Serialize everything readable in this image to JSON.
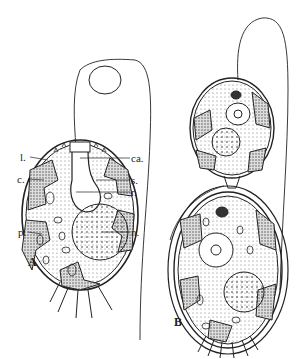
{
  "figure": {
    "panels": [
      {
        "id": "A",
        "label": "A",
        "description": "single flagellated cell with labeled structures"
      },
      {
        "id": "B",
        "label": "B",
        "description": "dividing cell pair with long flagellum"
      }
    ],
    "annotations": {
      "left": [
        {
          "key": "l",
          "text": "l."
        },
        {
          "key": "c",
          "text": "c."
        },
        {
          "key": "p",
          "text": "p."
        }
      ],
      "right": [
        {
          "key": "ca",
          "text": "ca."
        },
        {
          "key": "s",
          "text": "s."
        },
        {
          "key": "r",
          "text": "r."
        },
        {
          "key": "n",
          "text": "n."
        }
      ]
    },
    "colors": {
      "ink": "#222222",
      "background": "#ffffff",
      "stipple": "#888888"
    }
  }
}
